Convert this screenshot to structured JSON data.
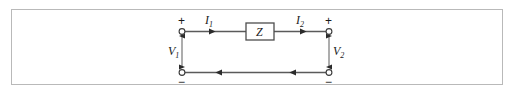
{
  "figure": {
    "kind": "two-port-impedance-circuit-diagram",
    "frame": {
      "border_color": "#b9b9b9",
      "background_color": "#ffffff"
    },
    "wire_color": "#4d4d4d",
    "label_color": "#1b1b1b"
  },
  "component": {
    "impedance_label": "Z",
    "box_stroke_color": "#4d4d4d"
  },
  "currents": {
    "left": {
      "symbol": "I",
      "subscript": "1",
      "direction": "right"
    },
    "right": {
      "symbol": "I",
      "subscript": "2",
      "direction": "right"
    }
  },
  "voltages": {
    "left": {
      "symbol": "V",
      "subscript": "1",
      "plus": "+",
      "minus": "−"
    },
    "right": {
      "symbol": "V",
      "subscript": "2",
      "plus": "+",
      "minus": "−"
    }
  },
  "return_path": {
    "arrow_direction": "left",
    "arrow_count": 2
  },
  "terminals": {
    "count": 4,
    "style": "open-circle"
  }
}
